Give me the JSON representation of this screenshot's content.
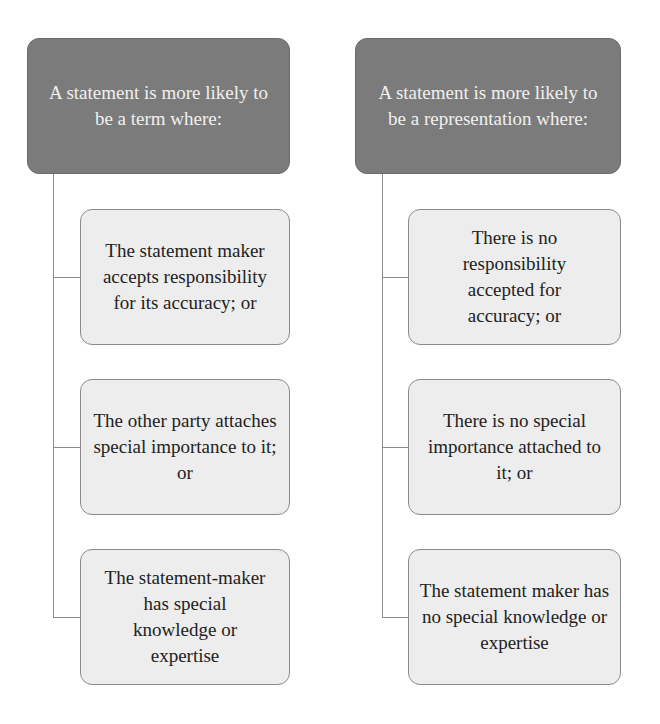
{
  "colors": {
    "header_fill": "#7b7b7b",
    "header_text": "#f0f0f0",
    "child_fill": "#ededed",
    "child_border": "#8a8a8a",
    "connector": "#8c8c8c"
  },
  "columns": [
    {
      "header": "A statement is more likely to be a term where:",
      "items": [
        "The statement maker accepts responsibility for its accuracy; or",
        "The other party attaches special importance to it; or",
        "The statement-maker has special knowledge or expertise"
      ]
    },
    {
      "header": "A statement is more likely to be a representation where:",
      "items": [
        "There is no responsibility accepted for accuracy; or",
        "There is no special importance attached to it; or",
        "The statement maker has no special knowledge or expertise"
      ]
    }
  ]
}
